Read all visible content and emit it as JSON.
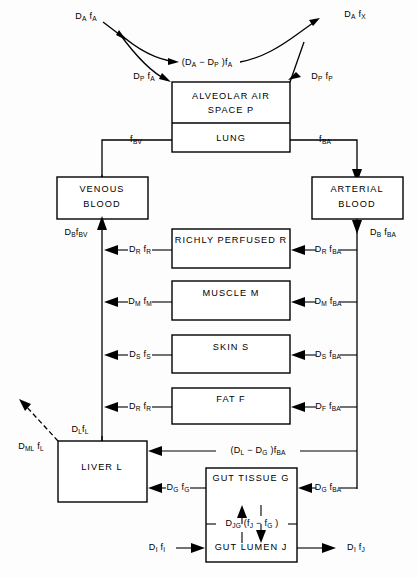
{
  "diagram": {
    "type": "flow-diagram",
    "background_color": "#ffffff",
    "line_color": "#000000",
    "boxes": [
      {
        "id": "alveolar",
        "label": "ALVEOLAR AIR SPACE P",
        "line1": "ALVEOLAR AIR",
        "line2": "SPACE P"
      },
      {
        "id": "lung",
        "label": "LUNG"
      },
      {
        "id": "venous",
        "label": "VENOUS BLOOD",
        "line1": "VENOUS",
        "line2": "BLOOD"
      },
      {
        "id": "arterial",
        "label": "ARTERIAL BLOOD",
        "line1": "ARTERIAL",
        "line2": "BLOOD"
      },
      {
        "id": "richly-perfused",
        "label": "RICHLY PERFUSED R"
      },
      {
        "id": "muscle",
        "label": "MUSCLE M"
      },
      {
        "id": "skin",
        "label": "SKIN S"
      },
      {
        "id": "fat",
        "label": "FAT F"
      },
      {
        "id": "liver",
        "label": "LIVER L"
      },
      {
        "id": "gut-tissue",
        "label": "GUT TISSUE G"
      },
      {
        "id": "gut-lumen",
        "label": "GUT LUMEN J"
      }
    ],
    "flows": [
      {
        "id": "inspired-air",
        "text": "D_A f_A",
        "base": "D",
        "sub": "A",
        "base2": "f",
        "sub2": "A"
      },
      {
        "id": "expired-air",
        "text": "D_A f_X",
        "base": "D",
        "sub": "A",
        "base2": "f",
        "sub2": "X"
      },
      {
        "id": "dead-space",
        "text": "(D_A - D_P) f_A"
      },
      {
        "id": "alveolar-in",
        "text": "D_P f_A",
        "base": "D",
        "sub": "P",
        "base2": "f",
        "sub2": "A"
      },
      {
        "id": "alveolar-out",
        "text": "D_P f_P",
        "base": "D",
        "sub": "P",
        "base2": "f",
        "sub2": "P"
      },
      {
        "id": "lung-venous",
        "text": "f_BV",
        "base2": "f",
        "sub2": "BV"
      },
      {
        "id": "lung-arterial",
        "text": "f_BA",
        "base2": "f",
        "sub2": "BA"
      },
      {
        "id": "blood-venous",
        "text": "D_B f_BV",
        "base": "D",
        "sub": "B",
        "base2": "f",
        "sub2": "BV"
      },
      {
        "id": "blood-arterial",
        "text": "D_B f_BA",
        "base": "D",
        "sub": "B",
        "base2": "f",
        "sub2": "BA"
      },
      {
        "id": "richly-out",
        "text": "D_R f_R",
        "base": "D",
        "sub": "R",
        "base2": "f",
        "sub2": "R"
      },
      {
        "id": "richly-in",
        "text": "D_R f_BA",
        "base": "D",
        "sub": "R",
        "base2": "f",
        "sub2": "BA"
      },
      {
        "id": "muscle-out",
        "text": "D_M f_M",
        "base": "D",
        "sub": "M",
        "base2": "f",
        "sub2": "M"
      },
      {
        "id": "muscle-in",
        "text": "D_M f_BA",
        "base": "D",
        "sub": "M",
        "base2": "f",
        "sub2": "BA"
      },
      {
        "id": "skin-out",
        "text": "D_S f_S",
        "base": "D",
        "sub": "S",
        "base2": "f",
        "sub2": "S"
      },
      {
        "id": "skin-in",
        "text": "D_S f_BA",
        "base": "D",
        "sub": "S",
        "base2": "f",
        "sub2": "BA"
      },
      {
        "id": "fat-out",
        "text": "D_R f_R",
        "base": "D",
        "sub": "R",
        "base2": "f",
        "sub2": "R"
      },
      {
        "id": "fat-in",
        "text": "D_F f_BA",
        "base": "D",
        "sub": "F",
        "base2": "f",
        "sub2": "BA"
      },
      {
        "id": "liver-out",
        "text": "D_L f_L",
        "base": "D",
        "sub": "L",
        "base2": "f",
        "sub2": "L"
      },
      {
        "id": "liver-metabolism",
        "text": "D_ML f_L",
        "base": "D",
        "sub": "ML",
        "base2": "f",
        "sub2": "L"
      },
      {
        "id": "hepatic-artery",
        "text": "(D_L - D_G) f_BA"
      },
      {
        "id": "portal-vein",
        "text": "D_G f_G",
        "base": "D",
        "sub": "G",
        "base2": "f",
        "sub2": "G"
      },
      {
        "id": "gut-in",
        "text": "D_G f_BA",
        "base": "D",
        "sub": "G",
        "base2": "f",
        "sub2": "BA"
      },
      {
        "id": "gut-exchange",
        "text": "D_JG (f_J - f_G)"
      },
      {
        "id": "intestinal-input",
        "text": "D_I f_I",
        "base": "D",
        "sub": "I",
        "base2": "f",
        "sub2": "I"
      },
      {
        "id": "intestinal-output",
        "text": "D_I f_J",
        "base": "D",
        "sub": "I",
        "base2": "f",
        "sub2": "J"
      }
    ]
  }
}
